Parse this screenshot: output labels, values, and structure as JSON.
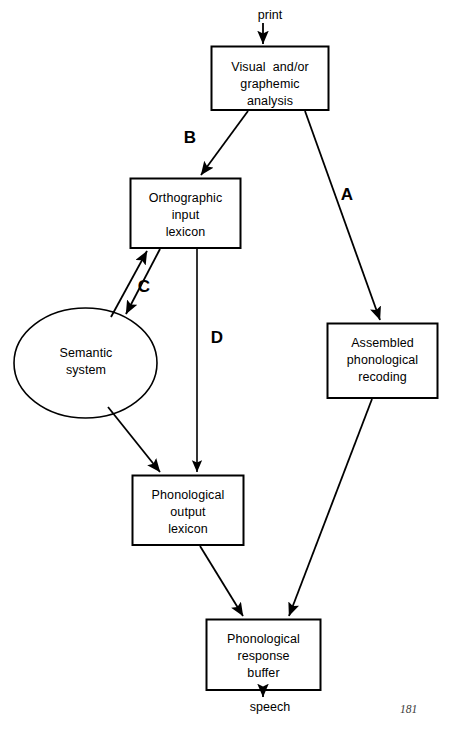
{
  "figure": {
    "type": "flow-diagram",
    "page_number": "181",
    "input_label": "print",
    "output_label": "speech",
    "nodes": [
      {
        "id": "visual",
        "shape": "rect",
        "text": "Visual  and/or\ngraphemic\nanalysis"
      },
      {
        "id": "ortho",
        "shape": "rect",
        "text": "Orthographic\ninput\nlexicon"
      },
      {
        "id": "semantic",
        "shape": "ellipse",
        "text": "Semantic\nsystem"
      },
      {
        "id": "assembled",
        "shape": "rect",
        "text": "Assembled\nphonological\nrecoding"
      },
      {
        "id": "phon_out",
        "shape": "rect",
        "text": "Phonological\noutput\nlexicon"
      },
      {
        "id": "phon_buf",
        "shape": "rect",
        "text": "Phonological\nresponse\nbuffer"
      }
    ],
    "route_labels": [
      {
        "id": "a",
        "text": "A"
      },
      {
        "id": "b",
        "text": "B"
      },
      {
        "id": "c",
        "text": "C"
      },
      {
        "id": "d",
        "text": "D"
      }
    ],
    "edges": [
      {
        "from": "print",
        "to": "visual",
        "style": "straight",
        "arrow": "single"
      },
      {
        "from": "visual",
        "to": "ortho",
        "style": "diagonal",
        "arrow": "single",
        "label": "B"
      },
      {
        "from": "visual",
        "to": "assembled",
        "style": "diagonal",
        "arrow": "single",
        "label": "A"
      },
      {
        "from": "ortho",
        "to": "semantic",
        "style": "diagonal-pair",
        "arrow": "double",
        "label": "C"
      },
      {
        "from": "ortho",
        "to": "phon_out",
        "style": "vertical",
        "arrow": "single",
        "label": "D"
      },
      {
        "from": "semantic",
        "to": "phon_out",
        "style": "diagonal",
        "arrow": "single"
      },
      {
        "from": "phon_out",
        "to": "phon_buf",
        "style": "diagonal",
        "arrow": "single"
      },
      {
        "from": "assembled",
        "to": "phon_buf",
        "style": "diagonal",
        "arrow": "single"
      },
      {
        "from": "phon_buf",
        "to": "speech",
        "style": "vertical",
        "arrow": "single"
      }
    ],
    "colors": {
      "stroke": "#000000",
      "background": "#ffffff",
      "page_number": "#3a3a3a"
    }
  }
}
